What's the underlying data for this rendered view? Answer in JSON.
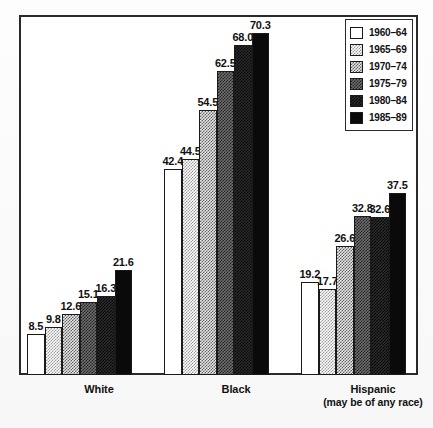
{
  "chart_data": {
    "type": "bar",
    "title": "",
    "xlabel": "",
    "ylabel": "",
    "grid": false,
    "ylim": [
      0,
      75
    ],
    "legend_position": "top-right",
    "categories": [
      "White",
      "Black",
      "Hispanic"
    ],
    "category_sublabels": [
      "",
      "",
      "(may be of any race)"
    ],
    "series": [
      {
        "name": "1960–64",
        "values": [
          8.5,
          42.4,
          19.2
        ],
        "fill": "white"
      },
      {
        "name": "1965–69",
        "values": [
          9.8,
          44.5,
          17.7
        ],
        "fill": "light-dither"
      },
      {
        "name": "1970–74",
        "values": [
          12.6,
          54.5,
          26.6
        ],
        "fill": "medium-dither"
      },
      {
        "name": "1975–79",
        "values": [
          15.1,
          62.5,
          32.8
        ],
        "fill": "dark-dither"
      },
      {
        "name": "1980–84",
        "values": [
          16.3,
          68.0,
          32.6
        ],
        "fill": "very-dark-dither"
      },
      {
        "name": "1985–89",
        "values": [
          21.6,
          70.3,
          37.5
        ],
        "fill": "black"
      }
    ],
    "value_labels": [
      [
        "8.5",
        "9.8",
        "12.6",
        "15.1",
        "16.3",
        "21.6"
      ],
      [
        "42.4",
        "44.5",
        "54.5",
        "62.5",
        "68.0",
        "70.3"
      ],
      [
        "19.2",
        "17.7",
        "26.6",
        "32.8",
        "32.6",
        "37.5"
      ]
    ]
  },
  "legend": {
    "items": [
      {
        "label": "1960–64"
      },
      {
        "label": "1965–69"
      },
      {
        "label": "1970–74"
      },
      {
        "label": "1975–79"
      },
      {
        "label": "1980–84"
      },
      {
        "label": "1985–89"
      }
    ]
  },
  "axis": {
    "categories": [
      {
        "label": "White",
        "sub": ""
      },
      {
        "label": "Black",
        "sub": ""
      },
      {
        "label": "Hispanic",
        "sub": "(may be of any race)"
      }
    ]
  }
}
